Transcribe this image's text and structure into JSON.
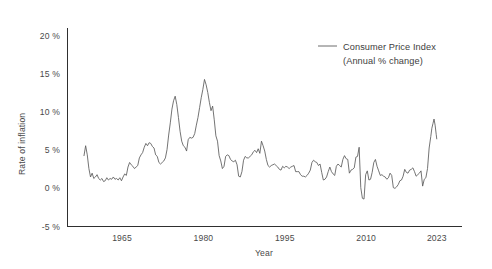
{
  "chart_data": {
    "type": "line",
    "title": "",
    "xlabel": "Year",
    "ylabel": "Rate of inflation",
    "xlim": [
      1958,
      2023
    ],
    "ylim": [
      -5,
      23
    ],
    "grid": false,
    "legend_position": "top-right",
    "xticks": [
      {
        "value": 1965,
        "label": "1965"
      },
      {
        "value": 1980,
        "label": "1980"
      },
      {
        "value": 1995,
        "label": "1995"
      },
      {
        "value": 2010,
        "label": "2010"
      },
      {
        "value": 2023,
        "label": "2023"
      }
    ],
    "yticks": [
      {
        "value": 20,
        "label": "20 %"
      },
      {
        "value": 15,
        "label": "15 %"
      },
      {
        "value": 10,
        "label": "10 %"
      },
      {
        "value": 5,
        "label": "5 %"
      },
      {
        "value": 0,
        "label": "0 %"
      },
      {
        "value": -5,
        "label": "-5 %"
      }
    ],
    "series": [
      {
        "name": "Consumer Price Index",
        "sublabel": "(Annual % change)",
        "color": "#5b5b5b",
        "x": [
          1958.0,
          1958.3,
          1958.6,
          1958.9,
          1959.2,
          1959.5,
          1959.8,
          1960.1,
          1960.4,
          1960.7,
          1961.0,
          1961.3,
          1961.6,
          1961.9,
          1962.2,
          1962.5,
          1962.8,
          1963.1,
          1963.4,
          1963.7,
          1964.0,
          1964.3,
          1964.6,
          1964.9,
          1965.2,
          1965.5,
          1965.8,
          1966.1,
          1966.4,
          1966.7,
          1967.0,
          1967.3,
          1967.6,
          1967.9,
          1968.2,
          1968.5,
          1968.8,
          1969.1,
          1969.4,
          1969.7,
          1970.0,
          1970.3,
          1970.6,
          1970.9,
          1971.2,
          1971.5,
          1971.8,
          1972.1,
          1972.4,
          1972.7,
          1973.0,
          1973.3,
          1973.6,
          1973.9,
          1974.2,
          1974.5,
          1974.8,
          1975.1,
          1975.4,
          1975.7,
          1976.0,
          1976.3,
          1976.6,
          1976.9,
          1977.2,
          1977.5,
          1977.8,
          1978.1,
          1978.4,
          1978.7,
          1979.0,
          1979.3,
          1979.6,
          1979.9,
          1980.2,
          1980.5,
          1980.8,
          1981.1,
          1981.4,
          1981.7,
          1982.0,
          1982.3,
          1982.6,
          1982.9,
          1983.2,
          1983.5,
          1983.8,
          1984.1,
          1984.4,
          1984.7,
          1985.0,
          1985.3,
          1985.6,
          1985.9,
          1986.2,
          1986.5,
          1986.8,
          1987.1,
          1987.4,
          1987.7,
          1988.0,
          1988.3,
          1988.6,
          1988.9,
          1989.2,
          1989.5,
          1989.8,
          1990.1,
          1990.4,
          1990.7,
          1991.0,
          1991.3,
          1991.6,
          1991.9,
          1992.2,
          1992.5,
          1992.8,
          1993.1,
          1993.4,
          1993.7,
          1994.0,
          1994.3,
          1994.6,
          1994.9,
          1995.2,
          1995.5,
          1995.8,
          1996.1,
          1996.4,
          1996.7,
          1997.0,
          1997.3,
          1997.6,
          1997.9,
          1998.2,
          1998.5,
          1998.8,
          1999.1,
          1999.4,
          1999.7,
          2000.0,
          2000.3,
          2000.6,
          2000.9,
          2001.2,
          2001.5,
          2001.8,
          2002.1,
          2002.4,
          2002.7,
          2003.0,
          2003.3,
          2003.6,
          2003.9,
          2004.2,
          2004.5,
          2004.8,
          2005.1,
          2005.4,
          2005.7,
          2006.0,
          2006.3,
          2006.6,
          2006.9,
          2007.2,
          2007.5,
          2007.8,
          2008.1,
          2008.4,
          2008.7,
          2009.0,
          2009.3,
          2009.6,
          2009.9,
          2010.2,
          2010.5,
          2010.8,
          2011.1,
          2011.4,
          2011.7,
          2012.0,
          2012.3,
          2012.6,
          2012.9,
          2013.2,
          2013.5,
          2013.8,
          2014.1,
          2014.4,
          2014.7,
          2015.0,
          2015.3,
          2015.6,
          2015.9,
          2016.2,
          2016.5,
          2016.8,
          2017.1,
          2017.4,
          2017.7,
          2018.0,
          2018.3,
          2018.6,
          2018.9,
          2019.2,
          2019.5,
          2019.8,
          2020.1,
          2020.4,
          2020.7,
          2021.0,
          2021.3,
          2021.6,
          2021.9,
          2022.1,
          2022.3,
          2022.5,
          2022.7,
          2022.9,
          2023.0
        ],
        "values": [
          4.3,
          5.6,
          4.4,
          2.6,
          1.5,
          2.0,
          1.3,
          1.5,
          1.8,
          1.3,
          1.1,
          1.3,
          0.9,
          1.0,
          1.4,
          1.1,
          1.3,
          1.2,
          1.5,
          1.2,
          1.3,
          1.1,
          1.4,
          1.0,
          1.5,
          1.9,
          1.7,
          2.8,
          3.4,
          3.1,
          2.9,
          2.6,
          2.8,
          3.0,
          4.0,
          4.4,
          4.7,
          5.4,
          5.9,
          5.6,
          6.0,
          5.9,
          5.5,
          5.3,
          4.4,
          4.2,
          3.4,
          3.2,
          3.4,
          3.6,
          4.0,
          5.1,
          7.0,
          8.6,
          10.4,
          11.5,
          12.1,
          11.0,
          9.3,
          7.5,
          6.2,
          5.6,
          5.4,
          4.9,
          6.4,
          6.7,
          6.6,
          6.7,
          7.2,
          8.3,
          9.3,
          10.6,
          11.9,
          13.0,
          14.3,
          13.6,
          12.6,
          11.3,
          10.2,
          10.8,
          9.0,
          6.9,
          6.2,
          4.3,
          3.6,
          2.6,
          2.9,
          4.2,
          4.4,
          4.3,
          3.8,
          3.6,
          3.5,
          3.7,
          3.1,
          1.6,
          1.5,
          2.2,
          3.7,
          4.2,
          4.0,
          4.0,
          4.2,
          4.4,
          4.8,
          5.0,
          4.7,
          5.2,
          4.6,
          6.2,
          5.6,
          4.9,
          3.8,
          3.0,
          2.8,
          3.0,
          3.1,
          3.2,
          3.0,
          2.8,
          2.5,
          2.4,
          2.9,
          2.7,
          2.9,
          2.8,
          2.6,
          2.8,
          2.9,
          3.0,
          2.2,
          2.2,
          2.2,
          1.8,
          1.6,
          1.6,
          1.5,
          1.7,
          2.0,
          2.4,
          3.4,
          3.7,
          3.5,
          3.4,
          3.0,
          3.2,
          2.1,
          1.1,
          1.2,
          1.5,
          2.2,
          2.8,
          2.2,
          1.9,
          1.7,
          2.9,
          3.2,
          3.0,
          2.8,
          3.8,
          4.3,
          3.9,
          3.8,
          2.0,
          2.4,
          2.5,
          2.7,
          4.1,
          4.2,
          5.4,
          0.1,
          -1.3,
          -1.4,
          1.8,
          2.3,
          1.1,
          1.2,
          2.1,
          3.4,
          3.8,
          2.9,
          2.3,
          1.7,
          1.8,
          1.6,
          1.5,
          1.2,
          1.4,
          2.0,
          1.7,
          0.1,
          0.0,
          0.2,
          0.5,
          1.0,
          1.1,
          1.6,
          2.5,
          2.1,
          2.0,
          2.4,
          2.5,
          2.7,
          2.2,
          1.6,
          1.8,
          2.0,
          2.3,
          0.3,
          1.2,
          1.4,
          2.6,
          5.3,
          6.8,
          7.9,
          8.5,
          9.1,
          8.3,
          7.1,
          6.5
        ]
      }
    ]
  },
  "legend": {
    "label": "Consumer Price Index",
    "sublabel": "(Annual % change)"
  },
  "axes": {
    "y_title": "Rate of inflation",
    "x_title": "Year"
  }
}
